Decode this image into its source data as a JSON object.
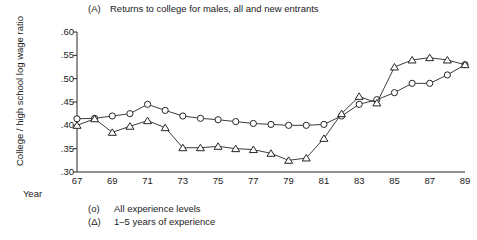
{
  "title": {
    "tag": "(A)",
    "text": "Returns to college for males, all and new entrants"
  },
  "axis": {
    "ylabel": "College / high school log wage ratio",
    "xlabel": "Year",
    "yticks": [
      ".60",
      ".55",
      ".50",
      ".45",
      ".40",
      ".35",
      ".30"
    ],
    "xticks": [
      "67",
      "69",
      "71",
      "73",
      "75",
      "77",
      "79",
      "81",
      "83",
      "85",
      "87",
      "89"
    ]
  },
  "legend": {
    "items": [
      {
        "symbol": "(o)",
        "label": "All experience levels"
      },
      {
        "symbol": "(Δ)",
        "label": "1–5 years of experience"
      }
    ]
  },
  "colors": {
    "line": "#262626",
    "text": "#1a1a1a",
    "background": "#ffffff"
  },
  "chart_data": {
    "type": "line",
    "xlabel": "Year",
    "ylabel": "College / high school log wage ratio",
    "xlim": [
      67,
      89
    ],
    "ylim": [
      0.3,
      0.6
    ],
    "ytick_values": [
      0.6,
      0.55,
      0.5,
      0.45,
      0.4,
      0.35,
      0.3
    ],
    "xtick_values": [
      67,
      69,
      71,
      73,
      75,
      77,
      79,
      81,
      83,
      85,
      87,
      89
    ],
    "grid": false,
    "legend_position": "below-axes",
    "x": [
      67,
      68,
      69,
      70,
      71,
      72,
      73,
      74,
      75,
      76,
      77,
      78,
      79,
      80,
      81,
      82,
      83,
      84,
      85,
      86,
      87,
      88,
      89
    ],
    "series": [
      {
        "name": "All experience levels",
        "marker": "circle",
        "values": [
          0.414,
          0.415,
          0.42,
          0.425,
          0.445,
          0.432,
          0.42,
          0.415,
          0.412,
          0.408,
          0.404,
          0.402,
          0.4,
          0.4,
          0.402,
          0.42,
          0.445,
          0.455,
          0.47,
          0.49,
          0.49,
          0.508,
          0.53
        ]
      },
      {
        "name": "1–5 years of experience",
        "marker": "triangle",
        "values": [
          0.4,
          0.414,
          0.385,
          0.398,
          0.41,
          0.395,
          0.352,
          0.352,
          0.355,
          0.35,
          0.348,
          0.34,
          0.325,
          0.33,
          0.372,
          0.425,
          0.462,
          0.448,
          0.525,
          0.54,
          0.545,
          0.54,
          0.53
        ]
      }
    ]
  }
}
